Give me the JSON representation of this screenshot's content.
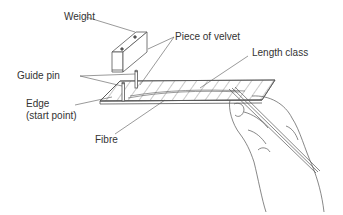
{
  "diagram": {
    "labels": {
      "weight": "Weight",
      "piece_of_velvet": "Piece of velvet",
      "length_class": "Length class",
      "guide_pin": "Guide pin",
      "edge_line1": "Edge",
      "edge_line2": "(start point)",
      "fibre": "Fibre"
    },
    "colors": {
      "line": "#555555",
      "text": "#333333",
      "background": "#ffffff"
    }
  }
}
